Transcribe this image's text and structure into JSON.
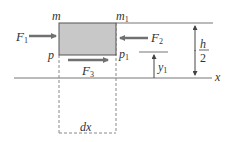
{
  "diagram": {
    "element": {
      "fill": "#c8c8c8",
      "stroke": "#555555",
      "corner_labels": {
        "top_left": "m",
        "top_right_base": "m",
        "top_right_sub": "1",
        "bottom_left": "p",
        "bottom_right_base": "p",
        "bottom_right_sub": "1"
      }
    },
    "forces": {
      "f1": {
        "base": "F",
        "sub": "1"
      },
      "f2": {
        "base": "F",
        "sub": "2"
      },
      "f3": {
        "base": "F",
        "sub": "3"
      }
    },
    "dimensions": {
      "half_height_num": "h",
      "half_height_den": "2",
      "y1_base": "y",
      "y1_sub": "1",
      "dx": "dx"
    },
    "axis": {
      "label": "x"
    },
    "colors": {
      "arrow": "#707070",
      "line": "#666666",
      "dash": "#888888"
    }
  }
}
